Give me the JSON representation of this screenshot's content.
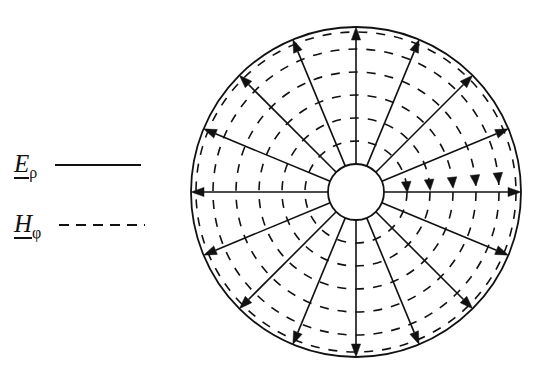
{
  "figure": {
    "title": "",
    "background_color": "#ffffff",
    "stroke_color": "#111111"
  },
  "legend": {
    "position": "left",
    "items": [
      {
        "id": "e-rho",
        "symbol_letter": "E",
        "symbol_subscript": "ρ",
        "underlined": true,
        "line_style": "solid",
        "line_color": "#111111",
        "meaning": "electric-field-radial"
      },
      {
        "id": "h-phi",
        "symbol_letter": "H",
        "symbol_subscript": "φ",
        "underlined": true,
        "line_style": "dashed",
        "line_color": "#111111",
        "meaning": "magnetic-field-azimuthal"
      }
    ]
  },
  "diagram": {
    "type": "coaxial-field-cross-section",
    "center": {
      "x": 356,
      "y": 192
    },
    "outer_circle": {
      "radius": 165,
      "style": "solid",
      "stroke_width": 1.8,
      "fill": "none"
    },
    "inner_circle": {
      "radius": 28,
      "style": "solid",
      "stroke_width": 1.8,
      "fill": "#ffffff"
    },
    "radial_arrows": {
      "count": 16,
      "style": "solid",
      "stroke_width": 1.6,
      "direction": "outward",
      "start_radius": 28,
      "end_radius": 165,
      "angles_deg": [
        0,
        22.5,
        45,
        67.5,
        90,
        112.5,
        135,
        157.5,
        180,
        202.5,
        225,
        247.5,
        270,
        292.5,
        315,
        337.5
      ],
      "arrowhead": "filled-triangle"
    },
    "dashed_arcs": {
      "count": 6,
      "style": "dashed",
      "stroke_width": 1.6,
      "dash_pattern": "9 9",
      "radii": [
        51,
        74,
        97,
        120,
        143,
        160
      ],
      "arrow_radii": [
        51,
        74,
        97,
        120,
        143
      ],
      "arrow_angle_deg": 0,
      "arrow_direction": "clockwise",
      "arrowhead": "filled-triangle"
    }
  }
}
